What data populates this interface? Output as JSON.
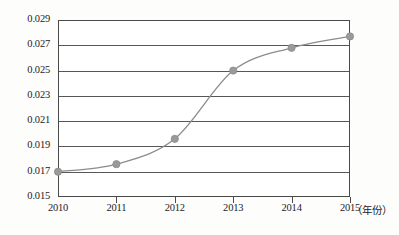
{
  "chart_data": {
    "type": "line",
    "title": "",
    "subtitle": "",
    "xlabel": "（年份）",
    "ylabel": "",
    "categories": [
      "2010",
      "2011",
      "2012",
      "2013",
      "2014",
      "2015"
    ],
    "x": [
      2010,
      2011,
      2012,
      2013,
      2014,
      2015
    ],
    "values": [
      0.017,
      0.0176,
      0.0196,
      0.025,
      0.0268,
      0.0277
    ],
    "series": [
      {
        "name": "",
        "values": [
          0.017,
          0.0176,
          0.0196,
          0.025,
          0.0268,
          0.0277
        ]
      }
    ],
    "ylim": [
      0.015,
      0.029
    ],
    "ytick_step": 0.002,
    "ytick_labels": [
      "0.029",
      "0.027",
      "0.025",
      "0.023",
      "0.021",
      "0.019",
      "0.017",
      "0.015"
    ],
    "ytick_values": [
      0.029,
      0.027,
      0.025,
      0.023,
      0.021,
      0.019,
      0.017,
      0.015
    ],
    "xtick_labels": [
      "2010",
      "2011",
      "2012",
      "2013",
      "2014",
      "2015"
    ],
    "grid": "horizontal",
    "legend": "none",
    "marker": "circle",
    "marker_color": "#9a9a9a",
    "line_color": "#8c8c8c",
    "axis_color": "#4a4a4a",
    "background_color": "#ffffff"
  }
}
